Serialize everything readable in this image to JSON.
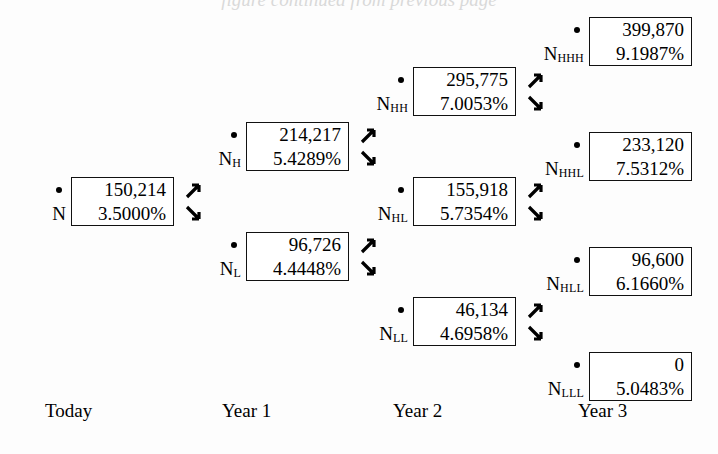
{
  "diagram": {
    "type": "binomial-interest-rate-tree",
    "background_color": "#fdfdfd",
    "ink_color": "#000000",
    "top_cropped_heading": "figure continued from previous page",
    "period_labels": [
      {
        "text": "Today",
        "x": 45,
        "y": 401
      },
      {
        "text": "Year 1",
        "x": 222,
        "y": 401
      },
      {
        "text": "Year 2",
        "x": 393,
        "y": 401
      },
      {
        "text": "Year 3",
        "x": 578,
        "y": 401
      }
    ],
    "arrow_icons": {
      "up": "arrow-up-right-icon",
      "down": "arrow-down-right-icon"
    },
    "nodes": [
      {
        "id": "N",
        "label": "N",
        "subscript": "",
        "value": "150,214",
        "rate": "3.5000%",
        "x": 10,
        "y": 177,
        "has_arrows": true
      },
      {
        "id": "NH",
        "label": "N",
        "subscript": "H",
        "value": "214,217",
        "rate": "5.4289%",
        "x": 185,
        "y": 122,
        "has_arrows": true
      },
      {
        "id": "NL",
        "label": "N",
        "subscript": "L",
        "value": "96,726",
        "rate": "4.4448%",
        "x": 185,
        "y": 232,
        "has_arrows": true
      },
      {
        "id": "NHH",
        "label": "N",
        "subscript": "HH",
        "value": "295,775",
        "rate": "7.0053%",
        "x": 352,
        "y": 67,
        "has_arrows": true
      },
      {
        "id": "NHL",
        "label": "N",
        "subscript": "HL",
        "value": "155,918",
        "rate": "5.7354%",
        "x": 352,
        "y": 177,
        "has_arrows": true
      },
      {
        "id": "NLL",
        "label": "N",
        "subscript": "LL",
        "value": "46,134",
        "rate": "4.6958%",
        "x": 352,
        "y": 297,
        "has_arrows": true
      },
      {
        "id": "NHHH",
        "label": "N",
        "subscript": "HHH",
        "value": "399,870",
        "rate": "9.1987%",
        "x": 528,
        "y": 17,
        "has_arrows": false
      },
      {
        "id": "NHHL",
        "label": "N",
        "subscript": "HHL",
        "value": "233,120",
        "rate": "7.5312%",
        "x": 528,
        "y": 132,
        "has_arrows": false
      },
      {
        "id": "NHLL",
        "label": "N",
        "subscript": "HLL",
        "value": "96,600",
        "rate": "6.1660%",
        "x": 528,
        "y": 247,
        "has_arrows": false
      },
      {
        "id": "NLLL",
        "label": "N",
        "subscript": "LLL",
        "value": "0",
        "rate": "5.0483%",
        "x": 528,
        "y": 352,
        "has_arrows": false
      }
    ]
  }
}
